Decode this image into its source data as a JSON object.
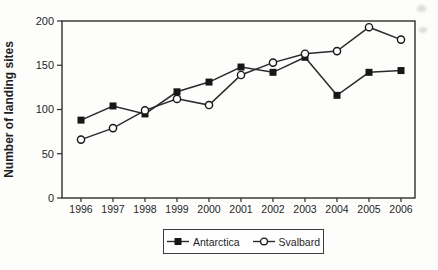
{
  "chart_data": {
    "type": "line",
    "title": "",
    "xlabel": "",
    "ylabel": "Number of landing sites",
    "categories": [
      "1996",
      "1997",
      "1998",
      "1999",
      "2000",
      "2001",
      "2002",
      "2003",
      "2004",
      "2005",
      "2006"
    ],
    "yticks": [
      0,
      50,
      100,
      150,
      200
    ],
    "ylim": [
      0,
      200
    ],
    "grid": false,
    "legend_position": "bottom-center",
    "series": [
      {
        "name": "Antarctica",
        "marker": "filled-square",
        "color": "#2b2b2b",
        "values": [
          88,
          104,
          95,
          120,
          131,
          148,
          142,
          159,
          116,
          142,
          144
        ]
      },
      {
        "name": "Svalbard",
        "marker": "open-circle",
        "color": "#2b2b2b",
        "values": [
          66,
          79,
          99,
          112,
          105,
          139,
          153,
          163,
          166,
          193,
          179
        ]
      }
    ]
  }
}
